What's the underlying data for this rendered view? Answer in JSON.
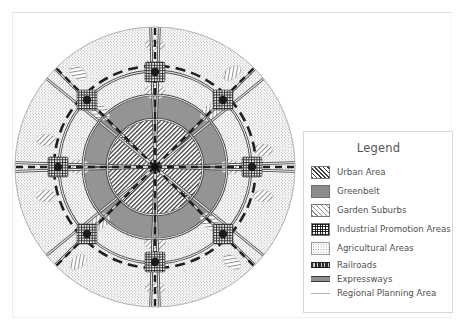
{
  "figure": {
    "type": "map-diagram",
    "center_label": "city-center"
  },
  "legend": {
    "title": "Legend",
    "items": [
      {
        "label": "Urban Area",
        "swatch": "urban-hatch-swatch",
        "kind": "area"
      },
      {
        "label": "Greenbelt",
        "swatch": "greenbelt-solid-swatch",
        "kind": "area"
      },
      {
        "label": "Garden Suburbs",
        "swatch": "garden-hatch-swatch",
        "kind": "area"
      },
      {
        "label": "Industrial Promotion Areas",
        "swatch": "industrial-grid-swatch",
        "kind": "area"
      },
      {
        "label": "Agricultural Areas",
        "swatch": "agricultural-dot-swatch",
        "kind": "area"
      },
      {
        "label": "Railroads",
        "swatch": "railroad-line-swatch",
        "kind": "line"
      },
      {
        "label": "Expressways",
        "swatch": "expressway-line-swatch",
        "kind": "line"
      },
      {
        "label": "Regional Planning Area",
        "swatch": "region-boundary-swatch",
        "kind": "line"
      }
    ]
  },
  "colors": {
    "urban_hatch": "#3a3a3a",
    "greenbelt": "#8c8c8c",
    "garden_hatch": "#8f8f8f",
    "industrial_grid": "#2f2f2f",
    "agricultural_dots": "#8a8a8a",
    "railroad": "#2b2b2b",
    "expressway": "#8d8d8d",
    "region_boundary": "#b0b0b0",
    "page_background": "#ffffff",
    "legend_border": "#d8d8d8",
    "text": "#4f4f4f"
  },
  "map_geometry": {
    "center": {
      "x": 155,
      "y": 167
    },
    "rings": [
      {
        "name": "urban-core-edge",
        "radius": 48
      },
      {
        "name": "greenbelt-outer-edge",
        "radius": 72
      },
      {
        "name": "outer-ring-road",
        "radius": 96
      },
      {
        "name": "regional-planning-edge",
        "radius": 140
      }
    ],
    "radial_corridors": 8,
    "industrial_node_radius": 96,
    "industrial_node_count": 8,
    "garden_suburb_patch_count": 16
  }
}
